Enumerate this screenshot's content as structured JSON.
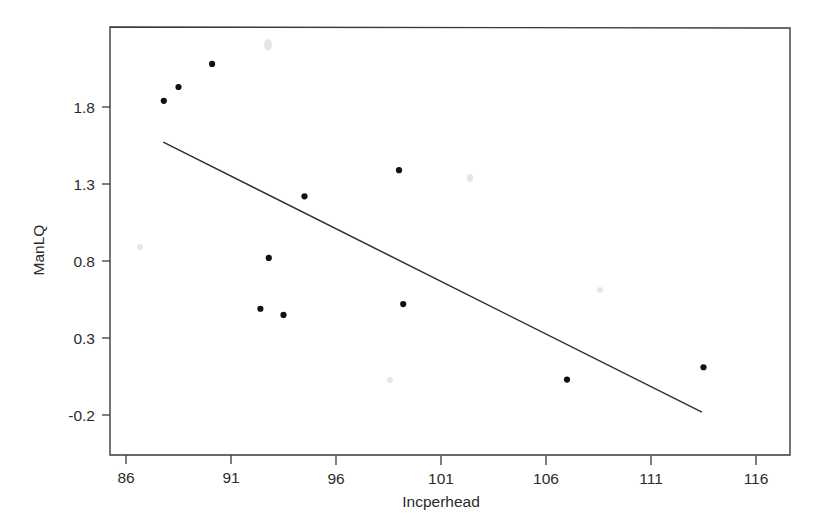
{
  "chart_data": {
    "type": "scatter",
    "title": "",
    "subtitle": "",
    "xlabel": "Incperhead",
    "ylabel": "ManLQ",
    "xlim": [
      85.2,
      117.5
    ],
    "ylim": [
      -0.42,
      2.22
    ],
    "xticks": [
      86,
      91,
      96,
      101,
      106,
      111,
      116
    ],
    "xtick_labels": [
      "86",
      "91",
      "96",
      "101",
      "106",
      "111",
      "116"
    ],
    "yticks": [
      1.8,
      1.3,
      0.8,
      0.3,
      -0.2
    ],
    "ytick_labels": [
      "1.8",
      "1.3",
      "0.8",
      "0.3",
      "-0.2"
    ],
    "grid": false,
    "legend": null,
    "legend_position": "none",
    "marker_color": "#111111",
    "line_color": "#303030",
    "frame_color": "#3a3a3a",
    "background": "#ffffff",
    "x": [
      87.8,
      88.5,
      90.1,
      92.4,
      92.8,
      93.5,
      94.5,
      99.0,
      99.2,
      107.0,
      113.5
    ],
    "y": [
      1.84,
      1.93,
      2.08,
      0.49,
      0.82,
      0.45,
      1.22,
      1.39,
      0.52,
      0.03,
      0.11
    ],
    "points": [
      {
        "x": 87.8,
        "y": 1.84
      },
      {
        "x": 88.5,
        "y": 1.93
      },
      {
        "x": 90.1,
        "y": 2.08
      },
      {
        "x": 92.4,
        "y": 0.49
      },
      {
        "x": 92.8,
        "y": 0.82
      },
      {
        "x": 93.5,
        "y": 0.45
      },
      {
        "x": 94.5,
        "y": 1.22
      },
      {
        "x": 99.0,
        "y": 1.39
      },
      {
        "x": 99.2,
        "y": 0.52
      },
      {
        "x": 107.0,
        "y": 0.03
      },
      {
        "x": 113.5,
        "y": 0.11
      }
    ],
    "fit_line": {
      "name": "regression line",
      "x_start": 87.8,
      "y_start": 1.57,
      "x_end": 113.4,
      "y_end": -0.18,
      "slope": -0.0684,
      "intercept": 7.573
    }
  },
  "axes": {
    "y_title": "ManLQ",
    "x_title": "Incperhead"
  }
}
